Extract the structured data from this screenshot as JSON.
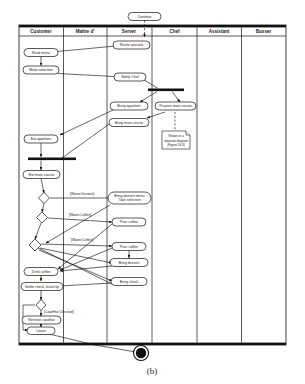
{
  "figure": {
    "caption": "(b)"
  },
  "swimlanes": [
    {
      "id": "customer",
      "label": "Customer"
    },
    {
      "id": "maitre_d",
      "label": "Maître d'"
    },
    {
      "id": "server",
      "label": "Server"
    },
    {
      "id": "chef",
      "label": "Chef"
    },
    {
      "id": "assistant",
      "label": "Assistant"
    },
    {
      "id": "busser",
      "label": "Busser"
    }
  ],
  "nodes": {
    "continue": {
      "label": "Continue",
      "lane": "server",
      "type": "activity"
    },
    "recite_specials": {
      "label": "Recite specials",
      "lane": "server",
      "type": "activity"
    },
    "read_menu": {
      "label": "Read menu",
      "lane": "customer",
      "type": "activity"
    },
    "make_selection": {
      "label": "Make selection",
      "lane": "customer",
      "type": "activity"
    },
    "notify_chef": {
      "label": "Notify Chef",
      "lane": "server",
      "type": "activity"
    },
    "bring_appetizer": {
      "label": "Bring appetizer",
      "lane": "server",
      "type": "activity"
    },
    "bring_main_course": {
      "label": "Bring main course",
      "lane": "server",
      "type": "activity"
    },
    "prepare_main_course": {
      "label": "Prepare main course",
      "lane": "chef",
      "type": "activity"
    },
    "eat_appetizer": {
      "label": "Eat appetizer",
      "lane": "customer",
      "type": "activity"
    },
    "eat_main_course": {
      "label": "Eat main course",
      "lane": "customer",
      "type": "activity"
    },
    "bring_dessert_menu": {
      "label": "Bring dessert menu",
      "label2": "Take selection",
      "lane": "server",
      "type": "activity"
    },
    "pour_coffee_1": {
      "label": "Pour coffee",
      "lane": "server",
      "type": "activity"
    },
    "pour_coffee_2": {
      "label": "Pour coffee",
      "lane": "server",
      "type": "activity"
    },
    "bring_dessert": {
      "label": "Bring dessert",
      "lane": "server",
      "type": "activity"
    },
    "bring_check": {
      "label": "Bring check",
      "lane": "server",
      "type": "activity"
    },
    "drink_coffee": {
      "label": "Drink coffee",
      "lane": "customer",
      "type": "activity"
    },
    "settle_check": {
      "label": "Settle check, leave tip",
      "lane": "customer",
      "type": "activity"
    },
    "retrieve_coat": {
      "label": "Retrieve coat/hat",
      "lane": "customer",
      "type": "activity"
    },
    "leave": {
      "label": "Leave",
      "lane": "customer",
      "type": "activity"
    }
  },
  "guards": [
    {
      "id": "wants_dessert",
      "label": "[Wants Dessert]"
    },
    {
      "id": "wants_coffee_1",
      "label": "[Wants Coffee]"
    },
    {
      "id": "wants_coffee_2",
      "label": "[Wants Coffee]"
    },
    {
      "id": "coat_checked",
      "label": "[Coat/Hat Checked]"
    }
  ],
  "note": {
    "line1": "Shown in a",
    "line2": "separate diagram",
    "line3": "(Figure 16.3)"
  },
  "colors": {
    "stroke": "#111111",
    "fill": "#ffffff",
    "bar": "#111111",
    "text": "#1a1a1a"
  }
}
